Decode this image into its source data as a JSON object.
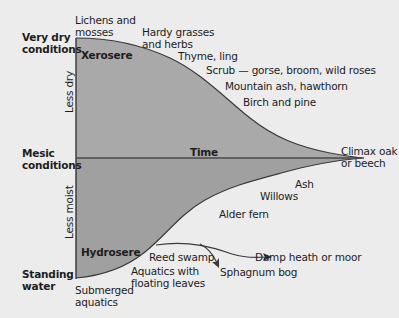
{
  "diagram": {
    "colors": {
      "background": "#ececec",
      "fill_upper": "#a8a8a8",
      "fill_lower": "#9e9e9e",
      "outline": "#3a3a3a",
      "text": "#1d1d1d"
    },
    "left_labels": {
      "very_dry_line1": "Very dry",
      "very_dry_line2": "conditions",
      "mesic_line1": "Mesic",
      "mesic_line2": "conditions",
      "standing_line1": "Standing",
      "standing_line2": "water"
    },
    "axis_labels": {
      "less_dry": "Less dry",
      "less_moist": "Less moist",
      "time": "Time"
    },
    "region_labels": {
      "xerosere": "Xerosere",
      "hydrosere": "Hydrosere"
    },
    "xerosere_stages": [
      {
        "line1": "Lichens and",
        "line2": "mosses"
      },
      {
        "line1": "Hardy grasses",
        "line2": "and herbs"
      },
      {
        "line1": "Thyme, ling"
      },
      {
        "line1": "Scrub — gorse, broom, wild roses"
      },
      {
        "line1": "Mountain ash, hawthorn"
      },
      {
        "line1": "Birch and pine"
      }
    ],
    "climax": {
      "line1": "Climax oak",
      "line2": "or beech"
    },
    "hydrosere_stages": [
      {
        "line1": "Submerged",
        "line2": "aquatics"
      },
      {
        "line1": "Aquatics with",
        "line2": "floating leaves"
      },
      {
        "line1": "Reed swamp"
      },
      {
        "line1": "Alder fern"
      },
      {
        "line1": "Willows"
      },
      {
        "line1": "Ash"
      }
    ],
    "branches": {
      "damp_heath": "Damp heath or moor",
      "sphagnum": "Sphagnum bog"
    }
  }
}
